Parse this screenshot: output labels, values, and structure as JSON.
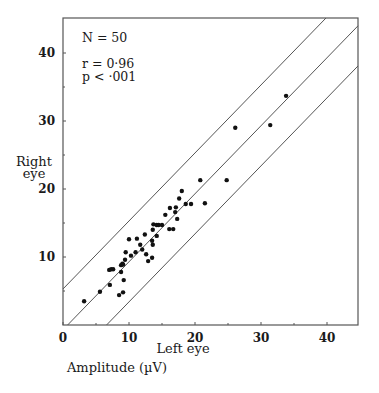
{
  "chart_data": {
    "type": "scatter",
    "title": "",
    "xlabel": "Left eye",
    "ylabel": "Right eye",
    "units_label": "Amplitude (µV)",
    "xlim": [
      0,
      45
    ],
    "ylim": [
      0,
      45
    ],
    "grid": false,
    "x_ticks": [
      0,
      10,
      20,
      30,
      40
    ],
    "y_ticks": [
      10,
      20,
      30,
      40
    ],
    "x_minor_ticks": [
      5,
      15,
      25,
      35
    ],
    "y_minor_ticks": [
      5,
      15,
      25,
      35
    ],
    "annotations": {
      "n": "N = 50",
      "r": "r  = 0·96",
      "p": "p  <  ·001"
    },
    "regression_lines": [
      {
        "name": "upper-bound",
        "slope": 1.0,
        "intercept": 5.3
      },
      {
        "name": "regression",
        "slope": 1.0,
        "intercept": -0.7
      },
      {
        "name": "lower-bound",
        "slope": 1.0,
        "intercept": -6.6
      }
    ],
    "series": [
      {
        "name": "subjects",
        "points": [
          [
            3.2,
            3.5
          ],
          [
            5.6,
            4.9
          ],
          [
            7.1,
            5.9
          ],
          [
            7.0,
            8.1
          ],
          [
            7.3,
            8.2
          ],
          [
            7.6,
            8.2
          ],
          [
            8.5,
            4.4
          ],
          [
            9.1,
            4.8
          ],
          [
            8.8,
            7.8
          ],
          [
            9.2,
            6.6
          ],
          [
            8.8,
            8.8
          ],
          [
            9.1,
            8.9
          ],
          [
            9.4,
            9.6
          ],
          [
            9.5,
            10.7
          ],
          [
            9.0,
            9.0
          ],
          [
            10.0,
            12.6
          ],
          [
            11.0,
            10.7
          ],
          [
            11.2,
            12.7
          ],
          [
            11.7,
            11.8
          ],
          [
            12.0,
            11.1
          ],
          [
            12.4,
            13.3
          ],
          [
            12.6,
            10.4
          ],
          [
            12.9,
            9.4
          ],
          [
            13.5,
            9.9
          ],
          [
            13.5,
            12.4
          ],
          [
            13.6,
            11.8
          ],
          [
            13.6,
            14.0
          ],
          [
            13.7,
            14.8
          ],
          [
            14.2,
            13.1
          ],
          [
            14.2,
            14.7
          ],
          [
            14.5,
            14.7
          ],
          [
            15.0,
            14.7
          ],
          [
            15.5,
            16.2
          ],
          [
            16.1,
            14.1
          ],
          [
            16.2,
            17.2
          ],
          [
            16.7,
            14.1
          ],
          [
            17.0,
            16.6
          ],
          [
            17.1,
            17.3
          ],
          [
            17.3,
            15.6
          ],
          [
            17.6,
            18.6
          ],
          [
            18.0,
            19.7
          ],
          [
            18.6,
            17.8
          ],
          [
            19.4,
            17.8
          ],
          [
            20.8,
            21.3
          ],
          [
            21.5,
            17.9
          ],
          [
            24.8,
            21.3
          ],
          [
            26.1,
            29.0
          ],
          [
            31.4,
            29.4
          ],
          [
            33.8,
            33.7
          ],
          [
            10.3,
            10.2
          ]
        ]
      }
    ]
  },
  "plot": {
    "x0": 63,
    "y0": 325,
    "px_per_x": 6.6,
    "px_per_y": 6.8,
    "frame": {
      "left": 63,
      "top": 18,
      "right": 358,
      "bottom": 325
    },
    "point_color": "#111111",
    "line_color": "#555555",
    "frame_color": "#555555"
  },
  "labels": {
    "ylabel_line1": "Right",
    "ylabel_line2": "eye",
    "xlabel": "Left eye",
    "units": "Amplitude (µV)"
  }
}
